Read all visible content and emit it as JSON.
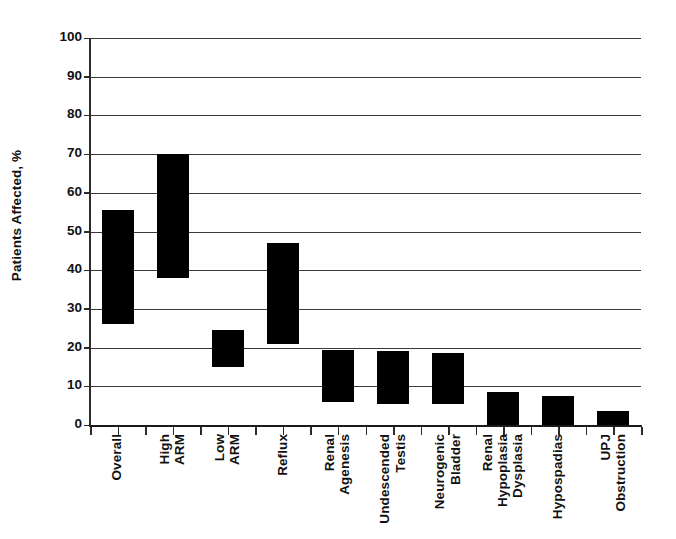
{
  "chart_data": {
    "type": "bar",
    "bar_style": "floating-range",
    "title": "",
    "xlabel": "",
    "ylabel": "Patients Affected, %",
    "ylim": [
      0,
      100
    ],
    "ytick_labels": [
      "100",
      "90",
      "80",
      "70",
      "60",
      "50",
      "40",
      "30",
      "20",
      "10",
      "0"
    ],
    "ytick_values": [
      100,
      90,
      80,
      70,
      60,
      50,
      40,
      30,
      20,
      10,
      0
    ],
    "grid": true,
    "legend": "none",
    "categories": [
      "Overall",
      "High ARM",
      "Low ARM",
      "Reflux",
      "Renal Agenesis",
      "Undescended Testis",
      "Neurogenic Bladder",
      "Renal Hypoplasia Dysplasia",
      "Hypospadias",
      "UPJ Obstruction"
    ],
    "category_label_lines": [
      [
        "Overall"
      ],
      [
        "High",
        "ARM"
      ],
      [
        "Low",
        "ARM"
      ],
      [
        "Reflux"
      ],
      [
        "Renal",
        "Agenesis"
      ],
      [
        "Undescended",
        "Testis"
      ],
      [
        "Neurogenic",
        "Bladder"
      ],
      [
        "Renal",
        "Hypoplasia",
        "Dysplasia"
      ],
      [
        "Hypospadias"
      ],
      [
        "UPJ",
        "Obstruction"
      ]
    ],
    "series": [
      {
        "name": "low",
        "values": [
          26.0,
          38.0,
          15.0,
          21.0,
          6.0,
          5.5,
          5.5,
          0.0,
          0.0,
          0.0
        ]
      },
      {
        "name": "high",
        "values": [
          55.5,
          70.0,
          24.5,
          47.0,
          19.5,
          19.0,
          18.5,
          8.5,
          7.5,
          3.5
        ]
      }
    ],
    "colors": {
      "bar": "#000000",
      "gridline": "#3a3a3a",
      "axis": "#2b2b2b",
      "text": "#111111",
      "background": "#ffffff"
    }
  }
}
